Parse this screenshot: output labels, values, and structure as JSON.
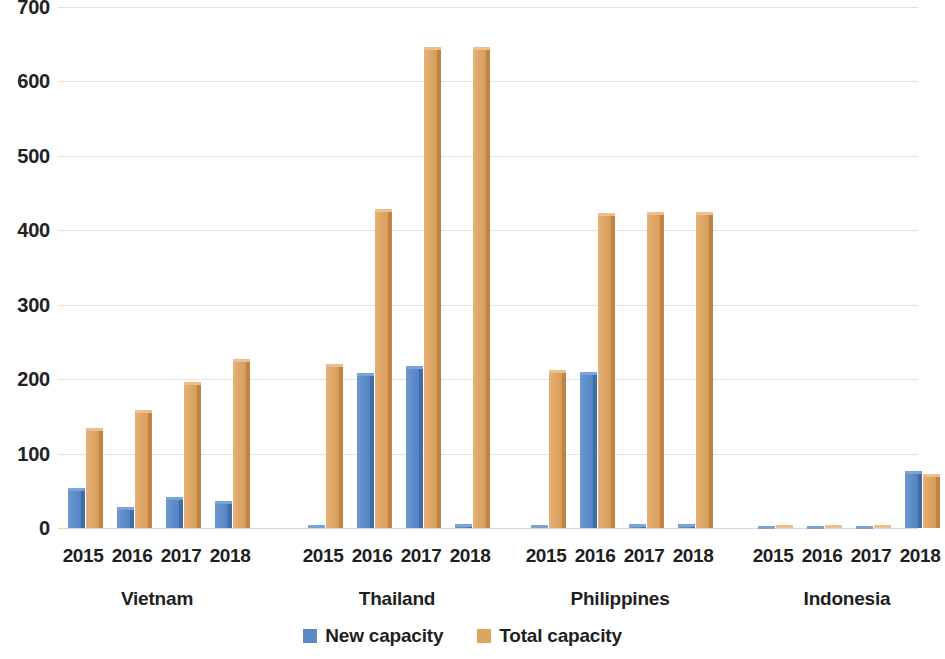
{
  "chart_data": {
    "type": "bar",
    "title": "",
    "subtitle": "",
    "xlabel": "",
    "ylabel": "",
    "ylim": [
      0,
      700
    ],
    "yticks": [
      0,
      100,
      200,
      300,
      400,
      500,
      600,
      700
    ],
    "grid": true,
    "legend_position": "bottom",
    "groups": [
      "Vietnam",
      "Thailand",
      "Philippines",
      "Indonesia"
    ],
    "categories": [
      "2015",
      "2016",
      "2017",
      "2018"
    ],
    "series": [
      {
        "name": "New capacity",
        "color": "#5b8ac6",
        "values_by_group": {
          "Vietnam": [
            54,
            28,
            41,
            36
          ],
          "Thailand": [
            4,
            208,
            218,
            5
          ],
          "Philippines": [
            4,
            210,
            5,
            5
          ],
          "Indonesia": [
            3,
            3,
            3,
            76
          ]
        }
      },
      {
        "name": "Total capacity",
        "color": "#dda463",
        "values_by_group": {
          "Vietnam": [
            134,
            159,
            196,
            227
          ],
          "Thailand": [
            221,
            429,
            646,
            646
          ],
          "Philippines": [
            212,
            423,
            424,
            424
          ],
          "Indonesia": [
            4,
            4,
            4,
            73
          ]
        }
      }
    ]
  },
  "axis": {
    "y_ticks": [
      "0",
      "100",
      "200",
      "300",
      "400",
      "500",
      "600",
      "700"
    ]
  },
  "legend": {
    "items": [
      {
        "label": "New capacity",
        "color": "#5b8ac6"
      },
      {
        "label": "Total capacity",
        "color": "#dda463"
      }
    ]
  },
  "groups": [
    {
      "name": "Vietnam",
      "years": [
        "2015",
        "2016",
        "2017",
        "2018"
      ]
    },
    {
      "name": "Thailand",
      "years": [
        "2015",
        "2016",
        "2017",
        "2018"
      ]
    },
    {
      "name": "Philippines",
      "years": [
        "2015",
        "2016",
        "2017",
        "2018"
      ]
    },
    {
      "name": "Indonesia",
      "years": [
        "2015",
        "2016",
        "2017",
        "2018"
      ]
    }
  ]
}
